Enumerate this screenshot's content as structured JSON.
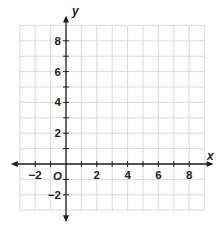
{
  "chart_data": {
    "type": "scatter",
    "title": "",
    "xlabel": "x",
    "ylabel": "y",
    "origin_label": "O",
    "xlim": [
      -3,
      9
    ],
    "ylim": [
      -3,
      9
    ],
    "grid": true,
    "grid_step": 1,
    "x_ticks": [
      -2,
      -1,
      1,
      2,
      3,
      4,
      5,
      6,
      7,
      8
    ],
    "y_ticks": [
      -2,
      -1,
      1,
      2,
      3,
      4,
      5,
      6,
      7,
      8
    ],
    "x_tick_labels": [
      {
        "value": -2,
        "label": "−2"
      },
      {
        "value": 2,
        "label": "2"
      },
      {
        "value": 4,
        "label": "4"
      },
      {
        "value": 6,
        "label": "6"
      },
      {
        "value": 8,
        "label": "8"
      }
    ],
    "y_tick_labels": [
      {
        "value": 8,
        "label": "8"
      },
      {
        "value": 6,
        "label": "6"
      },
      {
        "value": 4,
        "label": "4"
      },
      {
        "value": 2,
        "label": "2"
      },
      {
        "value": -2,
        "label": "−2"
      }
    ],
    "series": [],
    "colors": {
      "grid": "#cfcfcf",
      "axis": "#231f20"
    }
  }
}
